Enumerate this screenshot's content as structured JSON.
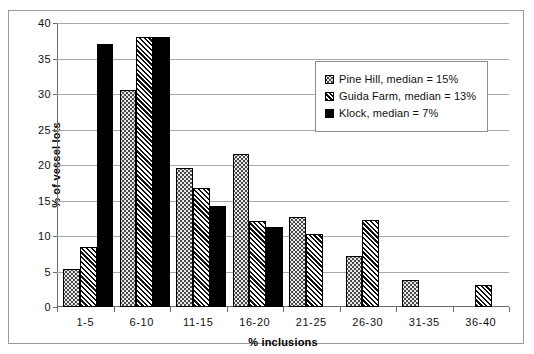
{
  "chart_data": {
    "type": "bar",
    "title": "",
    "xlabel": "% inclusions",
    "ylabel": "% of vessel lots",
    "categories": [
      "1-5",
      "6-10",
      "11-15",
      "16-20",
      "21-25",
      "26-30",
      "31-35",
      "36-40"
    ],
    "series": [
      {
        "name": "Pine Hill, median = 15%",
        "short_name": "Pine Hill",
        "pattern": "light-dotted",
        "values": [
          5.4,
          30.5,
          19.6,
          21.5,
          12.7,
          7.2,
          3.8,
          null
        ]
      },
      {
        "name": "Guida Farm, median = 13%",
        "short_name": "Guida Farm",
        "pattern": "diagonal-hatch",
        "values": [
          8.4,
          38.0,
          16.8,
          12.1,
          10.3,
          12.2,
          null,
          3.1
        ]
      },
      {
        "name": "Klock, median = 7%",
        "short_name": "Klock",
        "pattern": "solid-black",
        "values": [
          37.0,
          38.1,
          14.2,
          11.2,
          null,
          null,
          null,
          null
        ]
      }
    ],
    "ylim": [
      0,
      40
    ],
    "yticks": [
      0,
      5,
      10,
      15,
      20,
      25,
      30,
      35,
      40
    ],
    "ytick_labels": [
      "0",
      "5",
      "10",
      "15",
      "20",
      "25",
      "30",
      "35",
      "40"
    ],
    "grid": true,
    "legend_position": "upper-right"
  },
  "legend": {
    "entries": [
      {
        "label": "Pine Hill, median = 15%"
      },
      {
        "label": "Guida Farm, median = 13%"
      },
      {
        "label": "Klock, median = 7%"
      }
    ]
  },
  "colors": {
    "axis": "#6a6a6a",
    "grid": "#a8a8a8",
    "border": "#9a9a9a",
    "bar_outline": "#000000",
    "klock_fill": "#000000",
    "pine_fill": "#e9e9e9",
    "guida_fill": "#d8d8d8",
    "text": "#000000"
  }
}
